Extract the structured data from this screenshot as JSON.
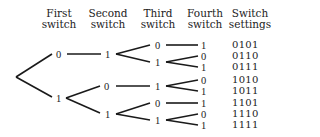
{
  "headers": {
    "first": [
      "First",
      "switch"
    ],
    "second": [
      "Second",
      "switch"
    ],
    "third": [
      "Third",
      "switch"
    ],
    "fourth": [
      "Fourth",
      "switch"
    ],
    "settings": [
      "Switch",
      "settings"
    ]
  },
  "nodes": {
    "first_0": "0",
    "first_1": "1",
    "second_a": "1",
    "second_b": "0",
    "second_c": "1",
    "third_a": "0",
    "third_b": "1",
    "third_c": "1",
    "third_d": "0",
    "third_e": "1",
    "fourth_1": "1",
    "fourth_2": "0",
    "fourth_3": "1",
    "fourth_4": "0",
    "fourth_5": "1",
    "fourth_6": "1",
    "fourth_7": "0",
    "fourth_8": "1"
  },
  "settings": [
    "0101",
    "0110",
    "0111",
    "1010",
    "1011",
    "1101",
    "1110",
    "1111"
  ],
  "line_color": "#1a1a1a"
}
